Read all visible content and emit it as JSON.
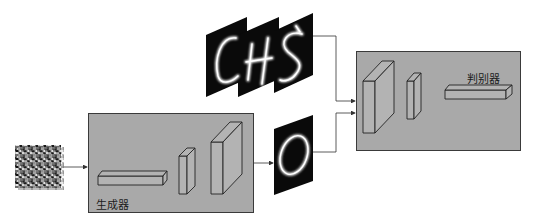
{
  "diagram": {
    "generator": {
      "label": "生成器"
    },
    "discriminator": {
      "label": "判别器"
    },
    "noise_input": {
      "name": "random-noise"
    },
    "real_samples": {
      "characters": [
        "C",
        "H",
        "S"
      ]
    },
    "generated_sample": {
      "character": "0"
    },
    "colors": {
      "box_fill": "#a9a9a9",
      "box_border": "#3a3a3a",
      "image_bg": "#0a0a0a",
      "stroke_glow": "#f0f0f0",
      "arrow": "#333333"
    }
  }
}
